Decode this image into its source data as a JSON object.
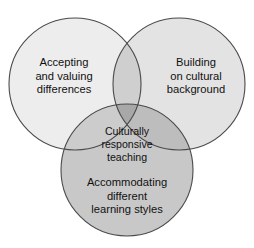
{
  "diagram": {
    "type": "venn-3-circle",
    "background_color": "#ffffff",
    "outline_color": "#4a4a4a",
    "text_color": "#111111",
    "circles": [
      {
        "id": "accepting",
        "label": "Accepting\nand valuing\ndifferences",
        "position": "left",
        "cx": 75,
        "cy": 84,
        "r": 66,
        "fill": "#ededed"
      },
      {
        "id": "building",
        "label": "Building\non cultural\nbackground",
        "position": "right",
        "cx": 179,
        "cy": 84,
        "r": 66,
        "fill": "#e3e3e3"
      },
      {
        "id": "accommodating",
        "label": "Accommodating\ndifferent\nlearning styles",
        "position": "bottom",
        "cx": 127,
        "cy": 170,
        "r": 66,
        "fill": "#c8c8c8"
      }
    ],
    "intersections": [
      {
        "id": "left-right",
        "fill": "#cfcfcf"
      },
      {
        "id": "left-bottom",
        "fill": "#cccccc"
      },
      {
        "id": "right-bottom",
        "fill": "#bdbdbd"
      }
    ],
    "center": {
      "id": "center",
      "label": "Culturally\nresponsive\nteaching",
      "fill": "#a8a8a8"
    }
  }
}
